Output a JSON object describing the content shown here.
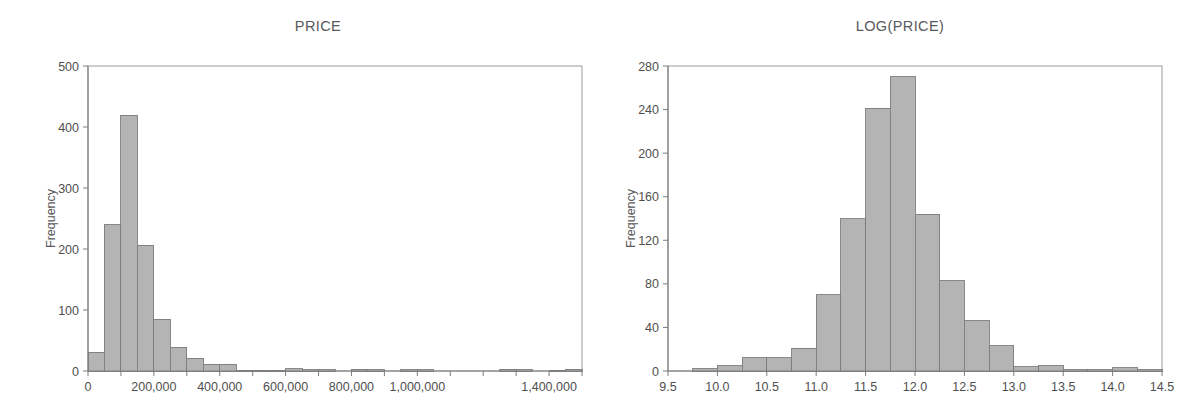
{
  "figure": {
    "width": 1180,
    "height": 410,
    "background": "#ffffff",
    "bar_fill": "#b4b4b4",
    "bar_stroke": "#7c7c7c",
    "axis_color": "#7d7d7d",
    "frame_color": "#9a9a9a",
    "text_color": "#4f4f4f"
  },
  "panels": [
    {
      "id": "price",
      "title": "PRICE",
      "ylabel": "Frequency"
    },
    {
      "id": "logprice",
      "title": "LOG(PRICE)",
      "ylabel": "Frequency"
    }
  ],
  "chart_data": [
    {
      "type": "bar",
      "id": "price",
      "title": "PRICE",
      "xlabel": "",
      "ylabel": "Frequency",
      "xlim": [
        0,
        1500000
      ],
      "ylim": [
        0,
        500
      ],
      "grid": false,
      "legend": null,
      "bin_width": 50000,
      "yticks": [
        0,
        100,
        200,
        300,
        400,
        500
      ],
      "ytick_labels": [
        "0",
        "100",
        "200",
        "300",
        "400",
        "500"
      ],
      "xticks": [
        0,
        100000,
        200000,
        300000,
        400000,
        500000,
        600000,
        700000,
        800000,
        900000,
        1000000,
        1100000,
        1200000,
        1300000,
        1400000,
        1500000
      ],
      "xtick_labels": [
        {
          "value": 0,
          "label": "0"
        },
        {
          "value": 200000,
          "label": "200,000"
        },
        {
          "value": 400000,
          "label": "400,000"
        },
        {
          "value": 600000,
          "label": "600,000"
        },
        {
          "value": 800000,
          "label": "800,000"
        },
        {
          "value": 1000000,
          "label": "1,000,000"
        },
        {
          "value": 1400000,
          "label": "1,400,000"
        }
      ],
      "bins": [
        {
          "x0": 0,
          "x1": 50000,
          "value": 31
        },
        {
          "x0": 50000,
          "x1": 100000,
          "value": 240
        },
        {
          "x0": 100000,
          "x1": 150000,
          "value": 419
        },
        {
          "x0": 150000,
          "x1": 200000,
          "value": 206
        },
        {
          "x0": 200000,
          "x1": 250000,
          "value": 85
        },
        {
          "x0": 250000,
          "x1": 300000,
          "value": 39
        },
        {
          "x0": 300000,
          "x1": 350000,
          "value": 21
        },
        {
          "x0": 350000,
          "x1": 400000,
          "value": 11
        },
        {
          "x0": 400000,
          "x1": 450000,
          "value": 11
        },
        {
          "x0": 450000,
          "x1": 500000,
          "value": 1
        },
        {
          "x0": 500000,
          "x1": 550000,
          "value": 1
        },
        {
          "x0": 550000,
          "x1": 600000,
          "value": 1
        },
        {
          "x0": 600000,
          "x1": 650000,
          "value": 4
        },
        {
          "x0": 650000,
          "x1": 700000,
          "value": 2
        },
        {
          "x0": 700000,
          "x1": 750000,
          "value": 2
        },
        {
          "x0": 750000,
          "x1": 800000,
          "value": 0
        },
        {
          "x0": 800000,
          "x1": 850000,
          "value": 3
        },
        {
          "x0": 850000,
          "x1": 900000,
          "value": 2
        },
        {
          "x0": 900000,
          "x1": 950000,
          "value": 0
        },
        {
          "x0": 950000,
          "x1": 1000000,
          "value": 2
        },
        {
          "x0": 1000000,
          "x1": 1050000,
          "value": 2
        },
        {
          "x0": 1050000,
          "x1": 1100000,
          "value": 0
        },
        {
          "x0": 1100000,
          "x1": 1150000,
          "value": 0
        },
        {
          "x0": 1150000,
          "x1": 1200000,
          "value": 0
        },
        {
          "x0": 1200000,
          "x1": 1250000,
          "value": 0
        },
        {
          "x0": 1250000,
          "x1": 1300000,
          "value": 3
        },
        {
          "x0": 1300000,
          "x1": 1350000,
          "value": 2
        },
        {
          "x0": 1350000,
          "x1": 1400000,
          "value": 0
        },
        {
          "x0": 1400000,
          "x1": 1450000,
          "value": 1
        },
        {
          "x0": 1450000,
          "x1": 1500000,
          "value": 3
        }
      ]
    },
    {
      "type": "bar",
      "id": "logprice",
      "title": "LOG(PRICE)",
      "xlabel": "",
      "ylabel": "Frequency",
      "xlim": [
        9.5,
        14.5
      ],
      "ylim": [
        0,
        280
      ],
      "grid": false,
      "legend": null,
      "bin_width": 0.25,
      "yticks": [
        0,
        40,
        80,
        120,
        160,
        200,
        240,
        280
      ],
      "ytick_labels": [
        "0",
        "40",
        "80",
        "120",
        "160",
        "200",
        "240",
        "280"
      ],
      "xticks": [
        9.5,
        10.0,
        10.5,
        11.0,
        11.5,
        12.0,
        12.5,
        13.0,
        13.5,
        14.0,
        14.5
      ],
      "xtick_labels": [
        {
          "value": 9.5,
          "label": "9.5"
        },
        {
          "value": 10.0,
          "label": "10.0"
        },
        {
          "value": 10.5,
          "label": "10.5"
        },
        {
          "value": 11.0,
          "label": "11.0"
        },
        {
          "value": 11.5,
          "label": "11.5"
        },
        {
          "value": 12.0,
          "label": "12.0"
        },
        {
          "value": 12.5,
          "label": "12.5"
        },
        {
          "value": 13.0,
          "label": "13.0"
        },
        {
          "value": 13.5,
          "label": "13.5"
        },
        {
          "value": 14.0,
          "label": "14.0"
        },
        {
          "value": 14.5,
          "label": "14.5"
        }
      ],
      "bins": [
        {
          "x0": 9.5,
          "x1": 9.75,
          "value": 0
        },
        {
          "x0": 9.75,
          "x1": 10.0,
          "value": 2
        },
        {
          "x0": 10.0,
          "x1": 10.25,
          "value": 5
        },
        {
          "x0": 10.25,
          "x1": 10.5,
          "value": 12
        },
        {
          "x0": 10.5,
          "x1": 10.75,
          "value": 12
        },
        {
          "x0": 10.75,
          "x1": 11.0,
          "value": 21
        },
        {
          "x0": 11.0,
          "x1": 11.25,
          "value": 70
        },
        {
          "x0": 11.25,
          "x1": 11.5,
          "value": 140
        },
        {
          "x0": 11.5,
          "x1": 11.75,
          "value": 241
        },
        {
          "x0": 11.75,
          "x1": 12.0,
          "value": 270
        },
        {
          "x0": 12.0,
          "x1": 12.25,
          "value": 144
        },
        {
          "x0": 12.25,
          "x1": 12.5,
          "value": 83
        },
        {
          "x0": 12.5,
          "x1": 12.75,
          "value": 46
        },
        {
          "x0": 12.75,
          "x1": 13.0,
          "value": 23
        },
        {
          "x0": 13.0,
          "x1": 13.25,
          "value": 4
        },
        {
          "x0": 13.25,
          "x1": 13.5,
          "value": 5
        },
        {
          "x0": 13.5,
          "x1": 13.75,
          "value": 1
        },
        {
          "x0": 13.75,
          "x1": 14.0,
          "value": 1
        },
        {
          "x0": 14.0,
          "x1": 14.25,
          "value": 3
        },
        {
          "x0": 14.25,
          "x1": 14.5,
          "value": 1
        }
      ]
    }
  ]
}
